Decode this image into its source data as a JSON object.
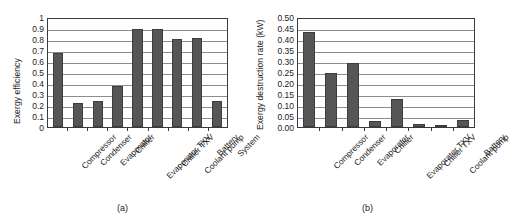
{
  "figure": {
    "panels": [
      {
        "key": "a",
        "caption": "(a)",
        "chart_data": {
          "type": "bar",
          "title": "",
          "xlabel": "",
          "ylabel": "Exergy efficiency",
          "ylim": [
            0,
            1
          ],
          "ytick_step": 0.1,
          "grid": true,
          "legend": "none",
          "categories": [
            "Compressor",
            "Condenser",
            "Evaporator",
            "Chiller",
            "Evaporator TXV",
            "Chiller TXV",
            "Coolant pump",
            "Battery",
            "System"
          ],
          "values": [
            0.67,
            0.215,
            0.235,
            0.37,
            0.89,
            0.89,
            0.8,
            0.81,
            0.24
          ],
          "ytick_labels": [
            "0",
            "0.1",
            "0.2",
            "0.3",
            "0.4",
            "0.5",
            "0.6",
            "0.7",
            "0.8",
            "0.9",
            "1"
          ]
        }
      },
      {
        "key": "b",
        "caption": "(b)",
        "chart_data": {
          "type": "bar",
          "title": "",
          "xlabel": "",
          "ylabel": "Exergy destruction rate (kW)",
          "ylim": [
            0,
            0.5
          ],
          "ytick_step": 0.05,
          "grid": true,
          "legend": "none",
          "categories": [
            "Compressor",
            "Condenser",
            "Evaporator",
            "Chiller",
            "Evaporator TXV",
            "Chiller TXV",
            "Coolant pump",
            "Battery"
          ],
          "values": [
            0.43,
            0.245,
            0.29,
            0.028,
            0.128,
            0.013,
            0.001,
            0.03
          ],
          "ytick_labels": [
            "0.00",
            "0.05",
            "0.10",
            "0.15",
            "0.20",
            "0.25",
            "0.30",
            "0.35",
            "0.40",
            "0.45",
            "0.50"
          ]
        }
      }
    ]
  },
  "style": {
    "bar_color": "#565656",
    "bar_edge_color": "#3d3d3d",
    "grid_color": "#8d8d8d",
    "axis_color": "#3a3a3a",
    "background": "#ffffff"
  }
}
